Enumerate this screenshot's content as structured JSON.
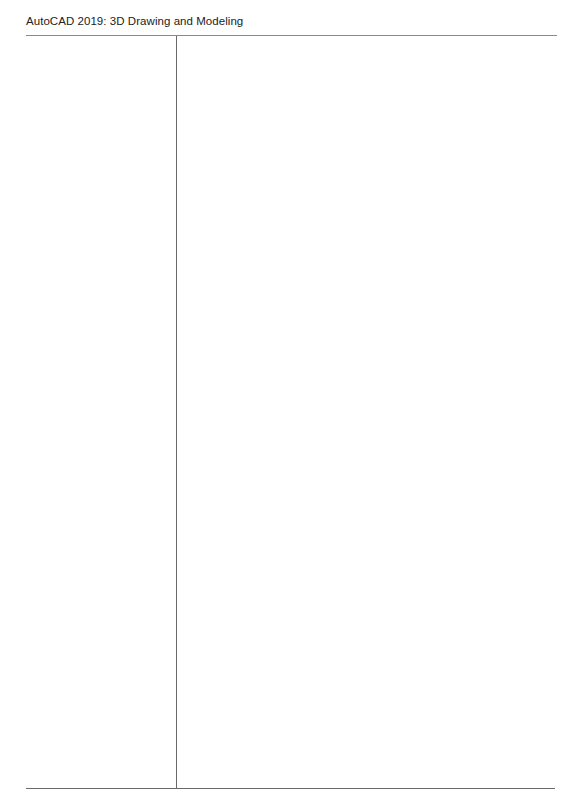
{
  "header": {
    "title": "AutoCAD 2019: 3D Drawing and Modeling"
  },
  "layout": {
    "columns": [
      {
        "name": "left-notes-column",
        "content": ""
      },
      {
        "name": "right-notes-column",
        "content": ""
      }
    ]
  },
  "colors": {
    "background": "#ffffff",
    "text": "#222222",
    "rule": "#6a6a6a"
  }
}
